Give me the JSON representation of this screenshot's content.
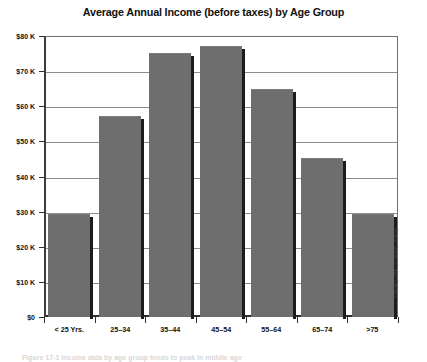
{
  "chart_data": {
    "type": "bar",
    "title": "Average Annual Income (before taxes) by Age Group",
    "xlabel": "",
    "ylabel": "",
    "categories": [
      "< 25 Yrs.",
      "25–34",
      "35–44",
      "45–54",
      "55–64",
      "65–74",
      ">75"
    ],
    "values": [
      29000,
      57000,
      75000,
      77000,
      64500,
      45000,
      29000
    ],
    "ylim": [
      0,
      80000
    ],
    "ytick_values": [
      0,
      10000,
      20000,
      30000,
      40000,
      50000,
      60000,
      70000,
      80000
    ],
    "ytick_labels": [
      "$0",
      "$10 K",
      "$20 K",
      "$30 K",
      "$40 K",
      "$50 K",
      "$60 K",
      "$70 K",
      "$80 K"
    ],
    "grid": true,
    "legend": false,
    "series_color": "#6e6e6e",
    "annotations": [
      "Source: Bureau of Labor Statistics"
    ]
  },
  "figure": {
    "title": "Average Annual Income (before taxes) by Age Group",
    "source_note": "Source: Bureau of Labor Statistics",
    "caption_fragment": "Figure  17-1  Income  data  by  age  group  tends  to  peak  in  middle  age"
  },
  "colors": {
    "bar_fill": "#6e6e6e",
    "bar_shadow": "#1c1c1c",
    "axis": "#2f2f2f",
    "gridline": "#8d8d8d",
    "text": "#111111",
    "background": "#ffffff"
  }
}
